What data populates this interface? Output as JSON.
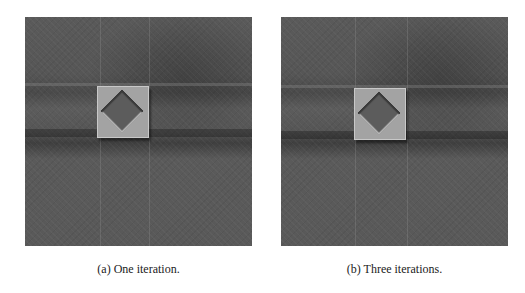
{
  "figure": {
    "subfigures": [
      {
        "label": "(a)",
        "caption": "(a) One iteration."
      },
      {
        "label": "(b)",
        "caption": "(b) Three iterations."
      }
    ],
    "colors": {
      "background": "#ffffff",
      "image_gray": "#555555",
      "square_gray": "#a3a3a3",
      "diamond_gray": "#5c5c5c"
    }
  }
}
